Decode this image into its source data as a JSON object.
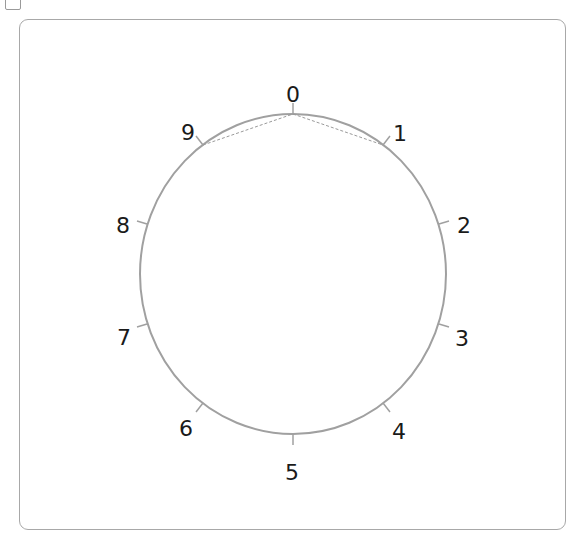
{
  "diagram": {
    "type": "circular-number-dial",
    "center": {
      "x": 293,
      "y": 274
    },
    "radius": {
      "rx": 153,
      "ry": 160
    },
    "circle_color": "#a0a0a0",
    "dashed_chord_color": "#9a9a9a",
    "labels": [
      {
        "text": "0",
        "x": 293,
        "y": 96
      },
      {
        "text": "1",
        "x": 400,
        "y": 135
      },
      {
        "text": "2",
        "x": 464,
        "y": 227
      },
      {
        "text": "3",
        "x": 462,
        "y": 340
      },
      {
        "text": "4",
        "x": 399,
        "y": 433
      },
      {
        "text": "5",
        "x": 292,
        "y": 474
      },
      {
        "text": "6",
        "x": 186,
        "y": 430
      },
      {
        "text": "7",
        "x": 124,
        "y": 339
      },
      {
        "text": "8",
        "x": 123,
        "y": 227
      },
      {
        "text": "9",
        "x": 188,
        "y": 134
      }
    ],
    "ticks": [
      {
        "x1": 293,
        "y1": 114,
        "x2": 293,
        "y2": 103
      },
      {
        "x1": 383,
        "y1": 145,
        "x2": 390,
        "y2": 136
      },
      {
        "x1": 439,
        "y1": 224,
        "x2": 449,
        "y2": 221
      },
      {
        "x1": 439,
        "y1": 324,
        "x2": 449,
        "y2": 327
      },
      {
        "x1": 383,
        "y1": 403,
        "x2": 390,
        "y2": 412
      },
      {
        "x1": 293,
        "y1": 434,
        "x2": 293,
        "y2": 445
      },
      {
        "x1": 203,
        "y1": 403,
        "x2": 196,
        "y2": 412
      },
      {
        "x1": 147,
        "y1": 324,
        "x2": 137,
        "y2": 327
      },
      {
        "x1": 147,
        "y1": 224,
        "x2": 137,
        "y2": 221
      },
      {
        "x1": 203,
        "y1": 145,
        "x2": 196,
        "y2": 136
      }
    ],
    "dashed_path": [
      {
        "from": "9",
        "to": "0",
        "x1": 203,
        "y1": 145,
        "x2": 293,
        "y2": 114
      },
      {
        "from": "0",
        "to": "1",
        "x1": 293,
        "y1": 114,
        "x2": 383,
        "y2": 145
      }
    ]
  }
}
